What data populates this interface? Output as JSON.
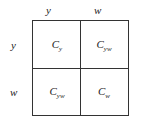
{
  "col_headers": [
    "y",
    "w"
  ],
  "row_headers": [
    "y",
    "w"
  ],
  "cells": [
    [
      {
        "base": "C",
        "sub": "y"
      },
      {
        "base": "C",
        "sub": "yw"
      }
    ],
    [
      {
        "base": "C",
        "sub": "yw"
      },
      {
        "base": "C",
        "sub": "w"
      }
    ]
  ]
}
